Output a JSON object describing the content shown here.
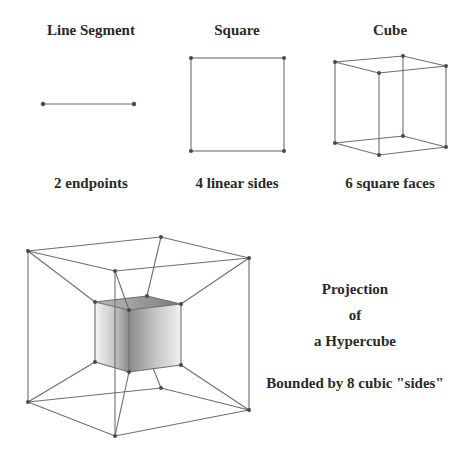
{
  "header": {
    "partial_title": ""
  },
  "panels": [
    {
      "title": "Line Segment",
      "caption": "2 endpoints"
    },
    {
      "title": "Square",
      "caption": "4 linear sides"
    },
    {
      "title": "Cube",
      "caption": "6 square faces"
    }
  ],
  "hypercube": {
    "title_line1": "Projection",
    "title_line2": "of",
    "title_line3": "a Hypercube",
    "caption": "Bounded by 8 cubic \"sides\""
  },
  "colors": {
    "edge": "#6e6e6e",
    "vertex": "#4a4a4a",
    "text": "#2a2a2a",
    "inner_cube_light": "#f2f2f2",
    "inner_cube_dark": "#8a8a8a",
    "inner_cube_top": "#7a7a7a"
  }
}
